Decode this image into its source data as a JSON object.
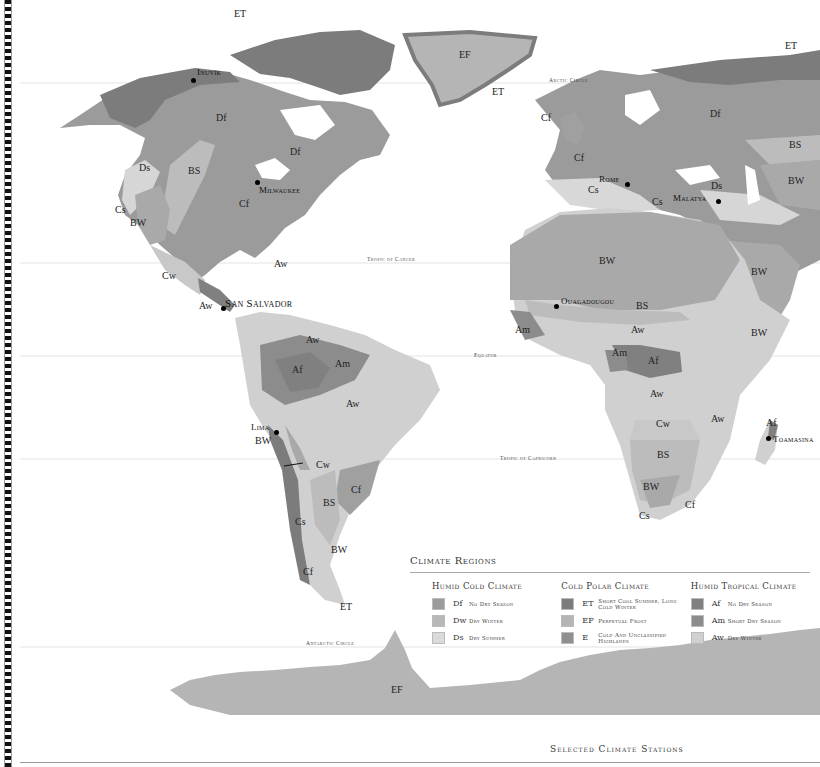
{
  "map": {
    "colors": {
      "Df": "#9b9b9b",
      "Dw": "#b8b8b8",
      "Ds": "#d6d6d6",
      "ET": "#7c7c7c",
      "EF": "#b5b5b5",
      "E": "#8f8f8f",
      "Af": "#808080",
      "Am": "#8c8c8c",
      "Aw": "#d0d0d0",
      "BS": "#bcbcbc",
      "BW": "#a9a9a9",
      "Cf": "#a0a0a0",
      "Cs": "#d8d8d8",
      "Cw": "#c8c8c8"
    },
    "reference_lines": {
      "arctic_circle": "Arctic Circle",
      "tropic_of_cancer": "Tropic of Cancer",
      "equator": "Equator",
      "tropic_of_capricorn": "Tropic of Capricorn",
      "antarctic_circle": "Antarctic Circle"
    },
    "region_labels": [
      {
        "code": "ET",
        "x": 240,
        "y": 14
      },
      {
        "code": "EF",
        "x": 465,
        "y": 55
      },
      {
        "code": "ET",
        "x": 498,
        "y": 92
      },
      {
        "code": "ET",
        "x": 791,
        "y": 46
      },
      {
        "code": "Df",
        "x": 222,
        "y": 118
      },
      {
        "code": "Df",
        "x": 296,
        "y": 152
      },
      {
        "code": "Ds",
        "x": 145,
        "y": 168
      },
      {
        "code": "BS",
        "x": 194,
        "y": 171
      },
      {
        "code": "Cf",
        "x": 245,
        "y": 204
      },
      {
        "code": "Cs",
        "x": 121,
        "y": 210
      },
      {
        "code": "BW",
        "x": 136,
        "y": 223
      },
      {
        "code": "Cf",
        "x": 547,
        "y": 118
      },
      {
        "code": "Cf",
        "x": 580,
        "y": 158
      },
      {
        "code": "Cs",
        "x": 594,
        "y": 190
      },
      {
        "code": "Cs",
        "x": 658,
        "y": 202
      },
      {
        "code": "Ds",
        "x": 717,
        "y": 186
      },
      {
        "code": "Df",
        "x": 716,
        "y": 114
      },
      {
        "code": "BS",
        "x": 795,
        "y": 145
      },
      {
        "code": "BW",
        "x": 794,
        "y": 181
      },
      {
        "code": "Aw",
        "x": 280,
        "y": 264
      },
      {
        "code": "Cw",
        "x": 168,
        "y": 276
      },
      {
        "code": "Aw",
        "x": 205,
        "y": 306
      },
      {
        "code": "Aw",
        "x": 312,
        "y": 340
      },
      {
        "code": "Af",
        "x": 298,
        "y": 370
      },
      {
        "code": "Am",
        "x": 341,
        "y": 364
      },
      {
        "code": "Aw",
        "x": 352,
        "y": 404
      },
      {
        "code": "BW",
        "x": 261,
        "y": 441
      },
      {
        "code": "Cw",
        "x": 322,
        "y": 465
      },
      {
        "code": "Cf",
        "x": 357,
        "y": 490
      },
      {
        "code": "BS",
        "x": 329,
        "y": 503
      },
      {
        "code": "Cs",
        "x": 301,
        "y": 522
      },
      {
        "code": "BW",
        "x": 337,
        "y": 550
      },
      {
        "code": "Cf",
        "x": 309,
        "y": 572
      },
      {
        "code": "ET",
        "x": 346,
        "y": 607
      },
      {
        "code": "BW",
        "x": 605,
        "y": 261
      },
      {
        "code": "BS",
        "x": 642,
        "y": 306
      },
      {
        "code": "Aw",
        "x": 637,
        "y": 330
      },
      {
        "code": "Am",
        "x": 618,
        "y": 353
      },
      {
        "code": "Af",
        "x": 654,
        "y": 361
      },
      {
        "code": "Am",
        "x": 521,
        "y": 330
      },
      {
        "code": "Aw",
        "x": 656,
        "y": 394
      },
      {
        "code": "Aw",
        "x": 717,
        "y": 419
      },
      {
        "code": "Cw",
        "x": 662,
        "y": 424
      },
      {
        "code": "BS",
        "x": 663,
        "y": 455
      },
      {
        "code": "BW",
        "x": 649,
        "y": 487
      },
      {
        "code": "Cf",
        "x": 691,
        "y": 505
      },
      {
        "code": "Cs",
        "x": 645,
        "y": 516
      },
      {
        "code": "BW",
        "x": 757,
        "y": 272
      },
      {
        "code": "BW",
        "x": 757,
        "y": 333
      },
      {
        "code": "Af",
        "x": 772,
        "y": 423
      },
      {
        "code": "EF",
        "x": 397,
        "y": 690
      }
    ],
    "cities": [
      {
        "name": "Inuvik",
        "dot_x": 193,
        "dot_y": 80,
        "label_x": 197,
        "label_y": 67
      },
      {
        "name": "Milwaukee",
        "dot_x": 257,
        "dot_y": 182,
        "label_x": 259,
        "label_y": 185
      },
      {
        "name": "San Salvador",
        "dot_x": 223,
        "dot_y": 308,
        "label_x": 225,
        "label_y": 297
      },
      {
        "name": "Lima",
        "dot_x": 276,
        "dot_y": 432,
        "label_x": 251,
        "label_y": 422
      },
      {
        "name": "Rome",
        "dot_x": 627,
        "dot_y": 184,
        "label_x": 599,
        "label_y": 174
      },
      {
        "name": "Malatya",
        "dot_x": 718,
        "dot_y": 201,
        "label_x": 673,
        "label_y": 193
      },
      {
        "name": "Ouagadougou",
        "dot_x": 556,
        "dot_y": 306,
        "label_x": 561,
        "label_y": 296
      },
      {
        "name": "Toamasina",
        "dot_x": 768,
        "dot_y": 438,
        "label_x": 773,
        "label_y": 434
      }
    ]
  },
  "legend": {
    "title": "Climate Regions",
    "groups": [
      {
        "title": "Humid Cold Climate",
        "items": [
          {
            "code": "Df",
            "label": "No Dry Season",
            "color": "#9b9b9b"
          },
          {
            "code": "Dw",
            "label": "Dry Winter",
            "color": "#b8b8b8"
          },
          {
            "code": "Ds",
            "label": "Dry Summer",
            "color": "#dadada"
          }
        ]
      },
      {
        "title": "Cold Polar Climate",
        "items": [
          {
            "code": "ET",
            "label": "Short Cool Summer, Long Cold Winter",
            "color": "#7c7c7c"
          },
          {
            "code": "EF",
            "label": "Perpetual Frost",
            "color": "#b5b5b5"
          },
          {
            "code": "E",
            "label": "Cold And Unclassified Highlands",
            "color": "#8f8f8f"
          }
        ]
      },
      {
        "title": "Humid Tropical Climate",
        "items": [
          {
            "code": "Af",
            "label": "No Dry Season",
            "color": "#808080"
          },
          {
            "code": "Am",
            "label": "Short Dry Season",
            "color": "#8c8c8c"
          },
          {
            "code": "Aw",
            "label": "Dry Winter",
            "color": "#d0d0d0"
          }
        ]
      }
    ]
  },
  "footer": {
    "section_title": "Selected Climate Stations"
  }
}
